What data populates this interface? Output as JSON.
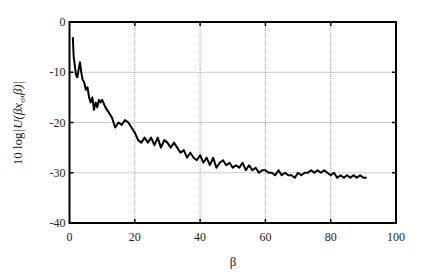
{
  "chart_data": {
    "type": "line",
    "title": "",
    "xlabel": "β",
    "ylabel": "10 log|U(βx_o,β)|",
    "ylabel_parts": {
      "prefix": "10 log",
      "main": "|U(βx",
      "sub": "o",
      "suffix": ",β)|"
    },
    "xlim": [
      0,
      100
    ],
    "ylim": [
      -40,
      0
    ],
    "xticks": [
      "0",
      "20",
      "40",
      "60",
      "80",
      "100"
    ],
    "yticks": [
      "0",
      "-10",
      "-20",
      "-30",
      "-40"
    ],
    "grid": true,
    "legend": null,
    "series": [
      {
        "name": "10 log|U(βx_o,β)|",
        "color": "#000000",
        "x": [
          1,
          1.3,
          1.6,
          2,
          2.4,
          2.8,
          3.2,
          3.6,
          4,
          4.5,
          5,
          5.5,
          6,
          6.5,
          7,
          7.5,
          8,
          8.5,
          9,
          9.5,
          10,
          11,
          12,
          13,
          14,
          15,
          16,
          17,
          18,
          19,
          20,
          21,
          22,
          23,
          24,
          25,
          26,
          27,
          28,
          29,
          30,
          31,
          32,
          33,
          34,
          35,
          36,
          37,
          38,
          39,
          40,
          41,
          42,
          43,
          44,
          45,
          46,
          47,
          48,
          49,
          50,
          51,
          52,
          53,
          54,
          55,
          56,
          57,
          58,
          59,
          60,
          61,
          62,
          63,
          64,
          65,
          66,
          67,
          68,
          69,
          70,
          71,
          72,
          73,
          74,
          75,
          76,
          77,
          78,
          79,
          80,
          81,
          82,
          83,
          84,
          85,
          86,
          87,
          88,
          89,
          90,
          91
        ],
        "values": [
          -3,
          -7,
          -8.5,
          -10.5,
          -11,
          -9.5,
          -8,
          -10,
          -11.5,
          -12,
          -13.5,
          -13,
          -15,
          -16,
          -15,
          -17.5,
          -16,
          -17,
          -15.5,
          -16,
          -15.5,
          -17,
          -18,
          -19,
          -21,
          -20,
          -20.5,
          -19.5,
          -20,
          -21,
          -22,
          -23.5,
          -24,
          -23,
          -24,
          -23,
          -24.5,
          -23,
          -25,
          -23.5,
          -24,
          -25,
          -24,
          -25,
          -26,
          -25.5,
          -27,
          -26,
          -27,
          -27.5,
          -26.5,
          -28,
          -27,
          -28.5,
          -27,
          -29,
          -28,
          -27.5,
          -28.5,
          -28,
          -29,
          -28.5,
          -29,
          -28,
          -29.5,
          -28.5,
          -29.5,
          -29,
          -30,
          -29.5,
          -29.5,
          -30,
          -30,
          -30.5,
          -29.5,
          -30.5,
          -30,
          -30.5,
          -30.5,
          -31,
          -30,
          -30.5,
          -30,
          -30,
          -29.5,
          -30,
          -29.5,
          -30,
          -29.5,
          -30,
          -30.5,
          -30,
          -31,
          -30.5,
          -31,
          -30.5,
          -31,
          -30.5,
          -31,
          -30.5,
          -31,
          -31
        ]
      }
    ]
  }
}
